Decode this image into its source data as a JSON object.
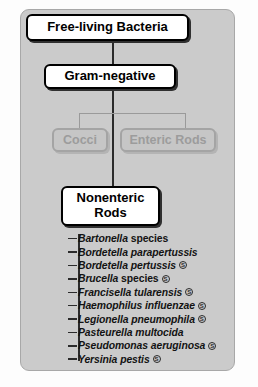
{
  "figure": {
    "panel_color": "#cbcbcb",
    "page_color": "#fdfdfd",
    "line_color": "#2b2b2b",
    "dim_color": "#9c9c9c"
  },
  "nodes": {
    "root": "Free-living Bacteria",
    "gram": "Gram-negative",
    "cocci": "Cocci",
    "enteric": "Enteric Rods",
    "nonenteric_line1": "Nonenteric",
    "nonenteric_line2": "Rods"
  },
  "badge": {
    "symbol": "S",
    "name": "circled-s-badge"
  },
  "species": [
    {
      "genus": "Bartonella",
      "epithet": "species",
      "epithet_italic": false,
      "badge": false
    },
    {
      "genus": "Bordetella",
      "epithet": "parapertussis",
      "epithet_italic": true,
      "badge": false
    },
    {
      "genus": "Bordetella",
      "epithet": "pertussis",
      "epithet_italic": true,
      "badge": true
    },
    {
      "genus": "Brucella",
      "epithet": "species",
      "epithet_italic": false,
      "badge": true
    },
    {
      "genus": "Francisella",
      "epithet": "tularensis",
      "epithet_italic": true,
      "badge": true
    },
    {
      "genus": "Haemophilus",
      "epithet": "influenzae",
      "epithet_italic": true,
      "badge": true
    },
    {
      "genus": "Legionella",
      "epithet": "pneumophila",
      "epithet_italic": true,
      "badge": true
    },
    {
      "genus": "Pasteurella",
      "epithet": "multocida",
      "epithet_italic": true,
      "badge": false
    },
    {
      "genus": "Pseudomonas",
      "epithet": "aeruginosa",
      "epithet_italic": true,
      "badge": true
    },
    {
      "genus": "Yersinia",
      "epithet": "pestis",
      "epithet_italic": true,
      "badge": true
    }
  ]
}
